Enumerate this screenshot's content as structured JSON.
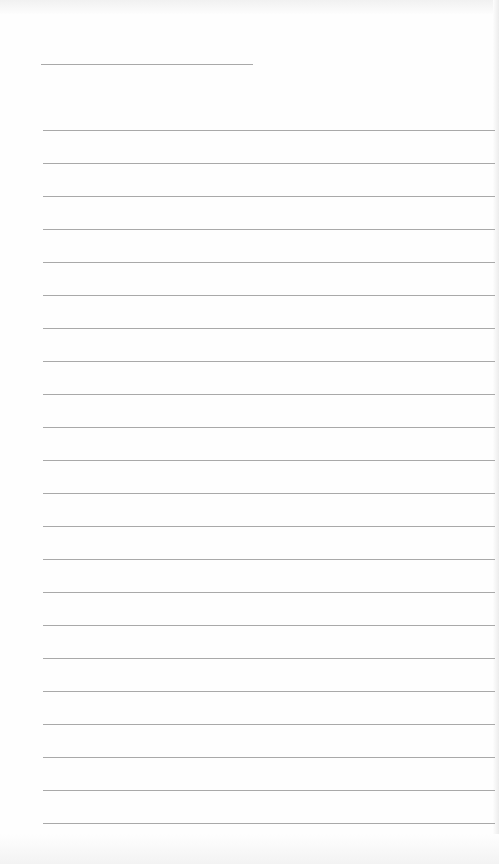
{
  "page": {
    "type": "lined-paper",
    "background": "#fefefe",
    "line_color": "#9a9a9a"
  },
  "title_line": {
    "x": 41,
    "y": 64,
    "width": 212
  },
  "ruled_lines": {
    "count": 22,
    "start_y": 130,
    "spacing": 33,
    "x": 43,
    "width": 452
  }
}
